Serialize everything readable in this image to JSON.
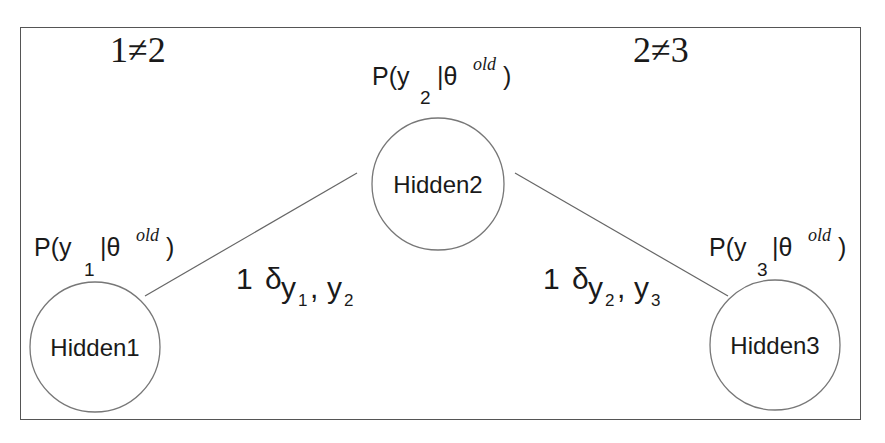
{
  "diagram": {
    "frame": {
      "left": 20,
      "top": 27,
      "right": 861,
      "bottom": 420
    },
    "colors": {
      "stroke": "#666666",
      "text": "#1a1a1a",
      "background": "#ffffff"
    },
    "inequalities": [
      {
        "id": "ineq-1-2",
        "text": "1≠2",
        "x": 163,
        "y": 62
      },
      {
        "id": "ineq-2-3",
        "text": "2≠3",
        "x": 686,
        "y": 62
      }
    ],
    "nodes": [
      {
        "id": "hidden1",
        "label": "Hidden1",
        "cx": 95,
        "cy": 347,
        "r": 65,
        "prob": {
          "prefix": "P(y",
          "sub": "1",
          "mid": "|θ",
          "sup": "old",
          "suffix": ")"
        }
      },
      {
        "id": "hidden2",
        "label": "Hidden2",
        "cx": 438,
        "cy": 184,
        "r": 66,
        "prob": {
          "prefix": "P(y",
          "sub": "2",
          "mid": "|θ",
          "sup": "old",
          "suffix": ")"
        }
      },
      {
        "id": "hidden3",
        "label": "Hidden3",
        "cx": 775,
        "cy": 345,
        "r": 65,
        "prob": {
          "prefix": "P(y",
          "sub": "3",
          "mid": "|θ",
          "sup": "old",
          "suffix": ")"
        }
      }
    ],
    "edges": [
      {
        "from": "hidden1",
        "to": "hidden2",
        "x1": 145,
        "y1": 296,
        "x2": 357,
        "y2": 173,
        "label": {
          "coef": "1",
          "delta": "δ",
          "var_a": "y",
          "sub_a": "1",
          "sep": ",",
          "var_b": "y",
          "sub_b": "2"
        }
      },
      {
        "from": "hidden2",
        "to": "hidden3",
        "x1": 515,
        "y1": 173,
        "x2": 728,
        "y2": 296,
        "label": {
          "coef": "1",
          "delta": "δ",
          "var_a": "y",
          "sub_a": "2",
          "sep": ",",
          "var_b": "y",
          "sub_b": "3"
        }
      }
    ]
  }
}
